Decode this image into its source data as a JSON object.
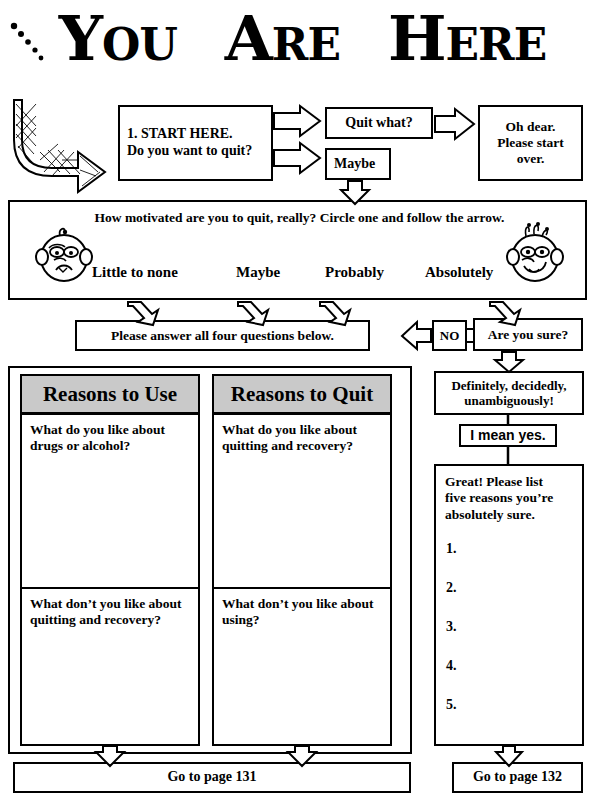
{
  "page": {
    "title_words": [
      {
        "id": "you",
        "cap": "Y",
        "rest": "OU"
      },
      {
        "id": "are",
        "cap": "A",
        "rest": "RE"
      },
      {
        "id": "here",
        "cap": "H",
        "rest": "ERE"
      }
    ],
    "title_text": "YOU ARE HERE"
  },
  "flow": {
    "start_box": {
      "line1": "1. START HERE.",
      "line2": "Do you want to quit?"
    },
    "quit_what": "Quit what?",
    "maybe": "Maybe",
    "oh_dear": "Oh dear.\nPlease start\nover.",
    "oh_dear_lines": [
      "Oh dear.",
      "Please start",
      "over."
    ]
  },
  "scale": {
    "question": "How motivated are you to quit, really? Circle one and follow the arrow.",
    "options": [
      "Little to none",
      "Maybe",
      "Probably",
      "Absolutely"
    ],
    "left_face": "sad-face-icon",
    "right_face": "happy-face-icon"
  },
  "midrow": {
    "answer_all": "Please answer all four questions below.",
    "no_label": "NO",
    "are_you_sure": "Are you sure?"
  },
  "columns": [
    {
      "header": "Reasons to Use",
      "q_top": "What do you like about\ndrugs or alcohol?",
      "q_top_lines": [
        "What do you like about",
        "drugs or alcohol?"
      ],
      "q_bottom_lines": [
        "What don’t you like about",
        "quitting and recovery?"
      ]
    },
    {
      "header": "Reasons to Quit",
      "q_top_lines": [
        "What do you like about",
        "quitting and recovery?"
      ],
      "q_bottom_lines": [
        "What don’t you like about",
        "using?"
      ]
    }
  ],
  "right_flow": {
    "definitely_lines": [
      "Definitely, decidedly,",
      "unambiguously!"
    ],
    "i_mean_yes": "I mean yes.",
    "great_lines": [
      "Great! Please list",
      "five reasons you’re",
      "absolutely sure."
    ],
    "numbers": [
      "1.",
      "2.",
      "3.",
      "4.",
      "5."
    ]
  },
  "footer": {
    "left_goto": "Go to page  131",
    "right_goto": "Go to page 132"
  },
  "colors": {
    "header_fill": "#c9c9c9",
    "ink": "#000000",
    "paper": "#ffffff"
  }
}
